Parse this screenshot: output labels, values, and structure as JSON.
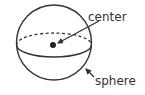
{
  "diagram": {
    "labels": {
      "center": "center",
      "sphere": "sphere"
    },
    "colors": {
      "stroke": "#333333",
      "background": "#ffffff"
    }
  }
}
